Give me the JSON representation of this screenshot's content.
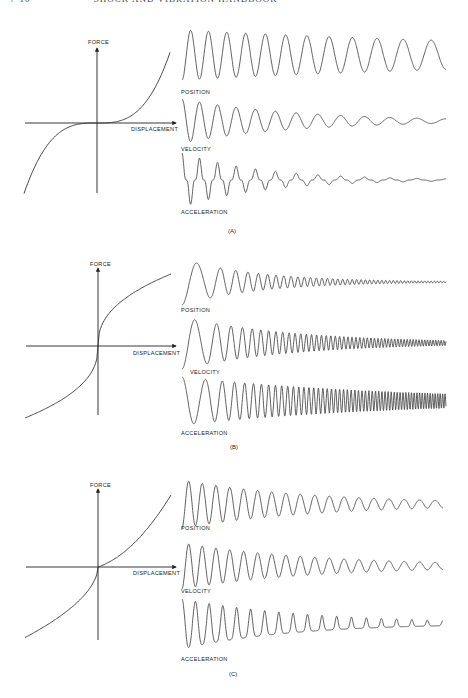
{
  "page_header": {
    "page_number": "7-10",
    "running_title": "SHOCK AND VIBRATION HANDBOOK"
  },
  "panels": [
    {
      "id": "A",
      "caption": "(A)",
      "caption_pos": [
        228,
        233
      ],
      "force_curve": {
        "type": "hardening-cubic",
        "axis_origin": [
          97,
          123
        ],
        "y_axis": [
          193,
          48
        ],
        "x_axis": [
          25,
          176
        ],
        "ylabel": "FORCE",
        "xlabel": "DISPLACEMENT",
        "ylabel_pos": [
          88,
          44
        ],
        "xlabel_pos": [
          131,
          131
        ]
      },
      "waves": [
        {
          "name": "position",
          "label": "POSITION",
          "label_pos": [
            181,
            94
          ],
          "x0": 182,
          "x1": 446,
          "cy": 55,
          "amp": 25,
          "decay": 0.55,
          "cycles": 12,
          "chirp": -0.55,
          "shape": "sine",
          "start": "down"
        },
        {
          "name": "velocity",
          "label": "VELOCITY",
          "label_pos": [
            181,
            151
          ],
          "x0": 182,
          "x1": 446,
          "cy": 121,
          "amp": 22,
          "decay": 2.3,
          "cycles": 12,
          "chirp": -0.55,
          "shape": "sine",
          "start": "up"
        },
        {
          "name": "acceleration",
          "label": "ACCELERATION",
          "label_pos": [
            181,
            214
          ],
          "x0": 182,
          "x1": 446,
          "cy": 180,
          "amp": 27,
          "decay": 3.2,
          "cycles": 12,
          "chirp": -0.55,
          "shape": "spike",
          "start": "up"
        }
      ]
    },
    {
      "id": "B",
      "caption": "(B)",
      "caption_pos": [
        230,
        449
      ],
      "force_curve": {
        "type": "softening-cuberoot",
        "axis_origin": [
          98,
          346
        ],
        "y_axis": [
          415,
          268
        ],
        "x_axis": [
          26,
          176
        ],
        "ylabel": "FORCE",
        "xlabel": "DISPLACEMENT",
        "ylabel_pos": [
          90,
          266
        ],
        "xlabel_pos": [
          133,
          355
        ]
      },
      "waves": [
        {
          "name": "position",
          "label": "POSITION",
          "label_pos": [
            181,
            312
          ],
          "x0": 182,
          "x1": 446,
          "cy": 282,
          "amp": 23,
          "decay": 3.4,
          "cycles": 45,
          "chirp": 1.9,
          "shape": "sine",
          "start": "down"
        },
        {
          "name": "velocity",
          "label": "VELOCITY",
          "label_pos": [
            190,
            374
          ],
          "x0": 182,
          "x1": 446,
          "cy": 343,
          "amp": 26,
          "decay": 2.3,
          "cycles": 52,
          "chirp": 1.9,
          "shape": "sine",
          "start": "down"
        },
        {
          "name": "acceleration",
          "label": "ACCELERATION",
          "label_pos": [
            181,
            435
          ],
          "x0": 182,
          "x1": 446,
          "cy": 401,
          "amp": 24,
          "decay": 1.2,
          "cycles": 56,
          "chirp": 1.9,
          "shape": "sine",
          "start": "up"
        }
      ]
    },
    {
      "id": "C",
      "caption": "(C)",
      "caption_pos": [
        229,
        676
      ],
      "force_curve": {
        "type": "asymmetric",
        "axis_origin": [
          98,
          567
        ],
        "y_axis": [
          640,
          489
        ],
        "x_axis": [
          26,
          176
        ],
        "ylabel": "FORCE",
        "xlabel": "DISPLACEMENT",
        "ylabel_pos": [
          90,
          487
        ],
        "xlabel_pos": [
          133,
          575
        ]
      },
      "waves": [
        {
          "name": "position",
          "label": "POSITION",
          "label_pos": [
            181,
            530
          ],
          "x0": 182,
          "x1": 443,
          "cy": 504,
          "amp": 24,
          "decay": 1.9,
          "cycles": 18,
          "chirp": -0.15,
          "shape": "asym",
          "start": "down"
        },
        {
          "name": "velocity",
          "label": "VELOCITY",
          "label_pos": [
            181,
            593
          ],
          "x0": 182,
          "x1": 443,
          "cy": 566,
          "amp": 23,
          "decay": 1.9,
          "cycles": 18,
          "chirp": -0.15,
          "shape": "sine",
          "start": "down"
        },
        {
          "name": "acceleration",
          "label": "ACCELERATION",
          "label_pos": [
            181,
            661
          ],
          "x0": 182,
          "x1": 443,
          "cy": 624,
          "amp": 25,
          "decay": 1.9,
          "cycles": 18,
          "chirp": -0.15,
          "shape": "peaky",
          "start": "up"
        }
      ]
    }
  ],
  "chart_data": [
    {
      "type": "line",
      "title": "(A) Hardening spring",
      "xlabel": "DISPLACEMENT",
      "ylabel": "FORCE",
      "description": "Force ~ cubic in displacement; flat near origin, steep at extremes. Free-vibration traces: POSITION, VELOCITY, ACCELERATION decay with frequency decreasing as amplitude drops.",
      "series": [
        {
          "name": "POSITION"
        },
        {
          "name": "VELOCITY"
        },
        {
          "name": "ACCELERATION"
        }
      ]
    },
    {
      "type": "line",
      "title": "(B) Softening spring",
      "xlabel": "DISPLACEMENT",
      "ylabel": "FORCE",
      "description": "Force rises steeply near origin then flattens (cube-root-like). Traces: frequency increases as amplitude decays; acceleration amplitude remains large.",
      "series": [
        {
          "name": "POSITION"
        },
        {
          "name": "VELOCITY"
        },
        {
          "name": "ACCELERATION"
        }
      ]
    },
    {
      "type": "line",
      "title": "(C) Asymmetric spring",
      "xlabel": "DISPLACEMENT",
      "ylabel": "FORCE",
      "description": "Asymmetric force-displacement curve; acceleration trace shows sharp one-sided peaks as amplitude decays.",
      "series": [
        {
          "name": "POSITION"
        },
        {
          "name": "VELOCITY"
        },
        {
          "name": "ACCELERATION"
        }
      ]
    }
  ]
}
